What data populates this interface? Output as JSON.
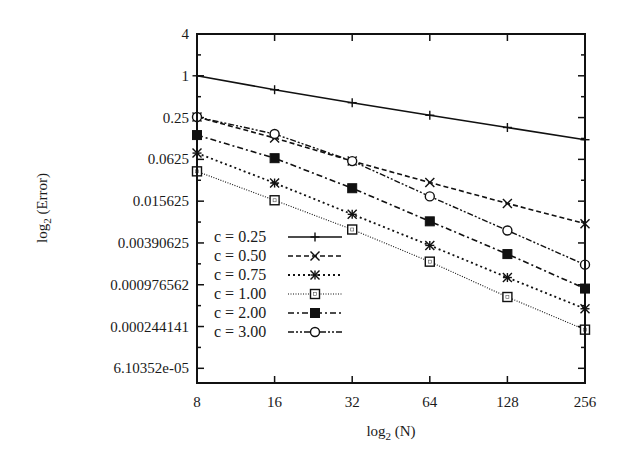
{
  "chart_data": {
    "type": "line",
    "title": "",
    "xlabel": "log2 (N)",
    "ylabel": "log2 (Error)",
    "x_scale": "log2",
    "y_scale": "log2",
    "x": [
      8,
      16,
      32,
      64,
      128,
      256
    ],
    "xlim": [
      8,
      256
    ],
    "ylim": [
      3.75e-05,
      4
    ],
    "x_ticks": [
      "8",
      "16",
      "32",
      "64",
      "128",
      "256"
    ],
    "y_ticks": [
      {
        "value": 4,
        "label": "4"
      },
      {
        "value": 1,
        "label": "1"
      },
      {
        "value": 0.25,
        "label": "0.25"
      },
      {
        "value": 0.0625,
        "label": "0.0625"
      },
      {
        "value": 0.015625,
        "label": "0.015625"
      },
      {
        "value": 0.00390625,
        "label": "0.00390625"
      },
      {
        "value": 0.000976562,
        "label": "0.000976562"
      },
      {
        "value": 0.000244141,
        "label": "0.000244141"
      },
      {
        "value": 6.10352e-05,
        "label": "6.10352e-05"
      }
    ],
    "grid": false,
    "legend_position": "bottom-left",
    "series": [
      {
        "name": "c = 0.25",
        "style": "solid",
        "marker": "plus",
        "values": [
          1.0,
          0.63,
          0.41,
          0.27,
          0.18,
          0.12
        ]
      },
      {
        "name": "c = 0.50",
        "style": "dashed",
        "marker": "cross",
        "values": [
          0.255,
          0.127,
          0.059,
          0.029,
          0.0145,
          0.0074
        ]
      },
      {
        "name": "c = 0.75",
        "style": "dotted",
        "marker": "star",
        "values": [
          0.077,
          0.0285,
          0.0101,
          0.0036,
          0.00124,
          0.00044
        ]
      },
      {
        "name": "c = 1.00",
        "style": "fine-dotted",
        "marker": "open-square",
        "values": [
          0.042,
          0.0161,
          0.0061,
          0.0021,
          0.00065,
          0.00022
        ]
      },
      {
        "name": "c = 2.00",
        "style": "dash-dot",
        "marker": "filled-square",
        "values": [
          0.14,
          0.065,
          0.024,
          0.008,
          0.0027,
          0.00086
        ]
      },
      {
        "name": "c = 3.00",
        "style": "dash-dot-dot",
        "marker": "open-circle",
        "values": [
          0.255,
          0.145,
          0.059,
          0.0183,
          0.0059,
          0.0019
        ]
      }
    ]
  }
}
